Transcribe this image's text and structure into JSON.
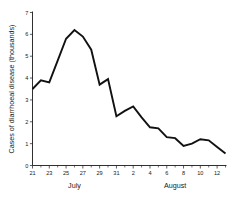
{
  "chart_data": {
    "type": "line",
    "title": "",
    "xlabel": "",
    "ylabel": "Cases of diarrhoeal disease (thousands)",
    "ylim": [
      0,
      7
    ],
    "yticks": [
      0,
      1,
      2,
      3,
      4,
      5,
      6,
      7
    ],
    "ytick_labels": [
      "0",
      "1",
      "2",
      "3",
      "4",
      "5",
      "6",
      "7"
    ],
    "grid": false,
    "legend": false,
    "x": [
      "21",
      "22",
      "23",
      "24",
      "25",
      "26",
      "27",
      "28",
      "29",
      "30",
      "31",
      "1",
      "2",
      "3",
      "4",
      "5",
      "6",
      "7",
      "8",
      "9",
      "10",
      "11",
      "12",
      "13"
    ],
    "xtick_labels": [
      "21",
      "",
      "23",
      "",
      "25",
      "",
      "27",
      "",
      "29",
      "",
      "31",
      "",
      "2",
      "",
      "4",
      "",
      "6",
      "",
      "8",
      "",
      "10",
      "",
      "12",
      ""
    ],
    "values": [
      3.5,
      3.9,
      3.8,
      4.8,
      5.8,
      6.2,
      5.9,
      5.3,
      3.7,
      3.95,
      2.25,
      2.5,
      2.7,
      2.2,
      1.75,
      1.7,
      1.3,
      1.25,
      0.9,
      1.0,
      1.2,
      1.15,
      0.85,
      0.55
    ],
    "x_groups": [
      {
        "label": "July",
        "start": "21",
        "end": "31"
      },
      {
        "label": "August",
        "start": "1",
        "end": "13"
      }
    ],
    "line_color": "#111111",
    "axis_color": "#1a1a1a",
    "background": "#ffffff"
  }
}
